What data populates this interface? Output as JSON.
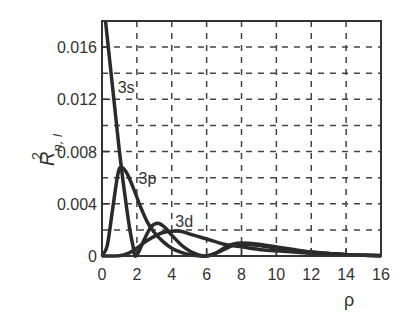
{
  "chart_data": {
    "type": "line",
    "title": "",
    "xlabel": "ρ",
    "ylabel": "R²n, l",
    "ylabel_parts": {
      "base": "R",
      "sup": "2",
      "sub": "n, l"
    },
    "xlim": [
      0,
      16
    ],
    "ylim": [
      0,
      0.018
    ],
    "x_ticks": [
      0,
      2,
      4,
      6,
      8,
      10,
      12,
      14,
      16
    ],
    "x_tick_labels": [
      "0",
      "2",
      "4",
      "6",
      "8",
      "10",
      "12",
      "14",
      "16"
    ],
    "y_ticks": [
      0,
      0.004,
      0.008,
      0.012,
      0.016
    ],
    "y_tick_labels": [
      "0",
      "0.004",
      "0.008",
      "0.012",
      "0.016"
    ],
    "grid": {
      "on": true,
      "style": "dashed",
      "x_step": 2,
      "y_step": 0.002
    },
    "legend": null,
    "series": [
      {
        "name": "3s",
        "label_pos": {
          "x": 0.9,
          "y": 0.0125
        },
        "x": [
          0.2,
          0.4,
          0.6,
          0.8,
          1.0,
          1.2,
          1.4,
          1.6,
          1.8,
          1.9,
          2.1,
          2.4,
          2.8,
          3.2,
          3.6,
          4.0,
          4.5,
          5.0,
          5.5,
          6.0,
          6.5,
          7.0,
          7.5,
          8.0,
          9.0,
          10.0,
          11.0,
          12.0,
          13.0,
          14.0,
          15.0,
          16.0
        ],
        "y": [
          0.018,
          0.0155,
          0.013,
          0.0105,
          0.008,
          0.0058,
          0.0038,
          0.002,
          0.0006,
          0.0,
          0.0003,
          0.0012,
          0.0022,
          0.0025,
          0.0022,
          0.0016,
          0.0009,
          0.0004,
          0.0001,
          0.0,
          0.0002,
          0.0006,
          0.0009,
          0.001,
          0.0009,
          0.0007,
          0.0005,
          0.0003,
          0.0002,
          0.0001,
          5e-05,
          2e-05
        ]
      },
      {
        "name": "3p",
        "label_pos": {
          "x": 2.1,
          "y": 0.0055
        },
        "x": [
          0.0,
          0.3,
          0.6,
          0.9,
          1.1,
          1.4,
          1.8,
          2.2,
          2.6,
          3.0,
          3.5,
          4.0,
          4.5,
          5.0,
          5.5,
          6.0,
          6.5,
          7.0,
          7.5,
          8.0,
          9.0,
          10.0,
          11.0,
          12.0,
          13.0,
          14.0,
          15.0,
          16.0
        ],
        "y": [
          0.0,
          0.0008,
          0.0035,
          0.0062,
          0.0068,
          0.0064,
          0.0052,
          0.0038,
          0.0026,
          0.0018,
          0.0011,
          0.0006,
          0.0003,
          0.0001,
          2e-05,
          0.0,
          0.0002,
          0.0005,
          0.0008,
          0.0009,
          0.0008,
          0.0006,
          0.0004,
          0.0003,
          0.0002,
          0.0001,
          5e-05,
          2e-05
        ]
      },
      {
        "name": "3d",
        "label_pos": {
          "x": 4.2,
          "y": 0.0022
        },
        "x": [
          0.0,
          1.0,
          1.5,
          2.0,
          2.5,
          3.0,
          3.5,
          4.0,
          4.5,
          5.0,
          5.5,
          6.0,
          6.5,
          7.0,
          7.5,
          8.0,
          9.0,
          10.0,
          11.0,
          12.0,
          13.0,
          14.0,
          15.0,
          16.0
        ],
        "y": [
          0.0,
          2e-05,
          0.0002,
          0.0006,
          0.0011,
          0.0015,
          0.0018,
          0.0019,
          0.0019,
          0.0017,
          0.0015,
          0.0013,
          0.0011,
          0.0009,
          0.0008,
          0.0007,
          0.0005,
          0.0004,
          0.0003,
          0.0002,
          0.00015,
          0.0001,
          6e-05,
          3e-05
        ]
      }
    ]
  }
}
